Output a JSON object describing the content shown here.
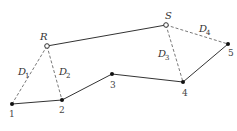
{
  "diagram": {
    "colors": {
      "line": "#333333",
      "dash": "#555555",
      "point": "#111111",
      "open_point_fill": "#ffffff"
    },
    "path_points": [
      {
        "id": "1",
        "label": "1",
        "x": 12,
        "y": 104
      },
      {
        "id": "2",
        "label": "2",
        "x": 62,
        "y": 100
      },
      {
        "id": "3",
        "label": "3",
        "x": 112,
        "y": 74
      },
      {
        "id": "4",
        "label": "4",
        "x": 183,
        "y": 82
      },
      {
        "id": "5",
        "label": "5",
        "x": 228,
        "y": 44
      }
    ],
    "stations": [
      {
        "id": "R",
        "label": "R",
        "x": 47,
        "y": 46
      },
      {
        "id": "S",
        "label": "S",
        "x": 166,
        "y": 25
      }
    ],
    "distances": [
      {
        "id": "D1",
        "letter": "D",
        "sub": "1",
        "from": "R",
        "to": "1"
      },
      {
        "id": "D2",
        "letter": "D",
        "sub": "2",
        "from": "R",
        "to": "2"
      },
      {
        "id": "D3",
        "letter": "D",
        "sub": "3",
        "from": "S",
        "to": "4"
      },
      {
        "id": "D4",
        "letter": "D",
        "sub": "4",
        "from": "S",
        "to": "5"
      }
    ]
  }
}
